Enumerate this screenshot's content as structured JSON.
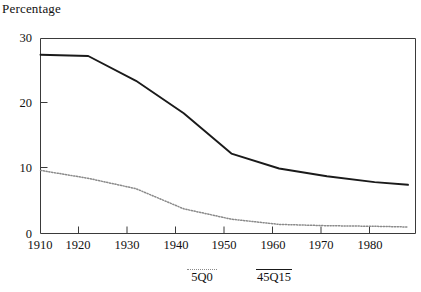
{
  "chart_data": {
    "type": "line",
    "title": "",
    "ylabel": "Percentage",
    "xlabel": "",
    "xlim": [
      1910,
      1987
    ],
    "ylim": [
      0,
      30
    ],
    "grid": false,
    "legend_position": "below-axis",
    "x": [
      1910,
      1920,
      1930,
      1940,
      1950,
      1960,
      1970,
      1980,
      1987
    ],
    "xticks": [
      1910,
      1920,
      1930,
      1940,
      1950,
      1960,
      1970,
      1980
    ],
    "xtick_labels": [
      "1910",
      "1920",
      "1930",
      "1940",
      "1950",
      "1960",
      "1970",
      "1980"
    ],
    "yticks": [
      0,
      10,
      20,
      30
    ],
    "ytick_labels": [
      "0",
      "10",
      "20",
      "30"
    ],
    "series": [
      {
        "name": "45Q15",
        "style": "solid",
        "color": "#1a1a1a",
        "values": [
          27.5,
          27.3,
          23.5,
          18.5,
          12.3,
          10.0,
          8.8,
          7.9,
          7.5
        ]
      },
      {
        "name": "5Q0",
        "style": "dotted",
        "color": "#8a8a8a",
        "values": [
          9.7,
          8.5,
          6.9,
          3.8,
          2.2,
          1.4,
          1.2,
          1.1,
          1.0
        ]
      }
    ]
  },
  "axis": {
    "y_title": "Percentage",
    "y_ticks": [
      "30",
      "20",
      "10",
      "0"
    ],
    "x_ticks": [
      "1910",
      "1920",
      "1930",
      "1940",
      "1950",
      "1960",
      "1970",
      "1980"
    ]
  },
  "legend": {
    "items": [
      {
        "label": "5Q0",
        "style": "dotted"
      },
      {
        "label": "45Q15",
        "style": "solid"
      }
    ]
  },
  "colors": {
    "solid_series": "#1a1a1a",
    "dotted_series": "#8a8a8a",
    "axis": "#3a3a3a",
    "text": "#111111",
    "background": "#ffffff"
  }
}
